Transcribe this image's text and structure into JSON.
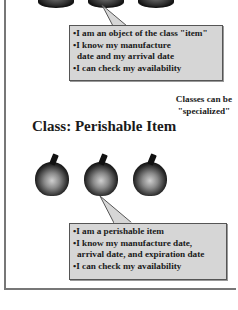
{
  "top_section": {
    "callout": {
      "lines": [
        "•I am an object of the class \"item\"",
        "•I know my manufacture",
        "date and my arrival date",
        "•I can check my availability"
      ]
    }
  },
  "note": {
    "line1": "Classes can be",
    "line2": "\"specialized\""
  },
  "perishable_section": {
    "title": "Class: Perishable Item",
    "apples": [
      "apple",
      "apple",
      "apple"
    ],
    "callout": {
      "lines": [
        "•I am a perishable item",
        "•I know my manufacture date,",
        "arrival date, and expiration date",
        "•I can check my availability"
      ]
    }
  },
  "colors": {
    "callout_fill": "#d6d6d6",
    "callout_border": "#555555",
    "frame": "#777777"
  }
}
